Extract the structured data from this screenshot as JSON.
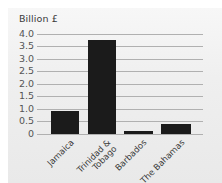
{
  "chart_data": {
    "type": "bar",
    "title": "",
    "ylabel": "Billion £",
    "xlabel": "",
    "categories": [
      "Jamaica",
      "Trinidad & Tobago",
      "Barbados",
      "The Bahamas"
    ],
    "category_labels": [
      [
        "Jamaica"
      ],
      [
        "Trinidad &",
        "Tobago"
      ],
      [
        "Barbados"
      ],
      [
        "The Bahamas"
      ]
    ],
    "values": [
      0.9,
      3.75,
      0.1,
      0.4
    ],
    "ylim": [
      0,
      4.0
    ],
    "yticks": [
      "4.0",
      "3.5",
      "3.0",
      "2.5",
      "2.0",
      "1.5",
      "1.0",
      "0.5",
      "0"
    ],
    "grid": true,
    "legend": "none",
    "bar_color": "#1b1b1b"
  }
}
